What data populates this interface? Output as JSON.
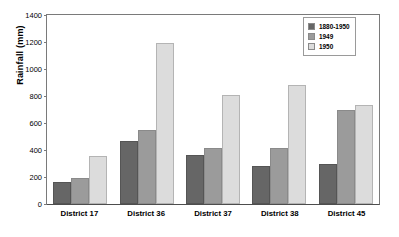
{
  "chart_data": {
    "type": "bar",
    "title": "",
    "xlabel": "",
    "ylabel": "Rainfall (mm)",
    "ylim": [
      0,
      1400
    ],
    "ytick_step": 200,
    "yticks": [
      "1400",
      "1200",
      "1000",
      "800",
      "600",
      "400",
      "200",
      "0"
    ],
    "grid": false,
    "legend_position": "top-right",
    "categories": [
      "District 17",
      "District 36",
      "District 37",
      "District 38",
      "District 45"
    ],
    "series": [
      {
        "name": "1880-1950",
        "color": "#666666",
        "values": [
          160,
          465,
          360,
          280,
          300
        ]
      },
      {
        "name": "1949",
        "color": "#9b9b9b",
        "values": [
          190,
          545,
          415,
          415,
          700
        ]
      },
      {
        "name": "1950",
        "color": "#dcdcdc",
        "values": [
          355,
          1190,
          805,
          885,
          735
        ]
      }
    ]
  }
}
